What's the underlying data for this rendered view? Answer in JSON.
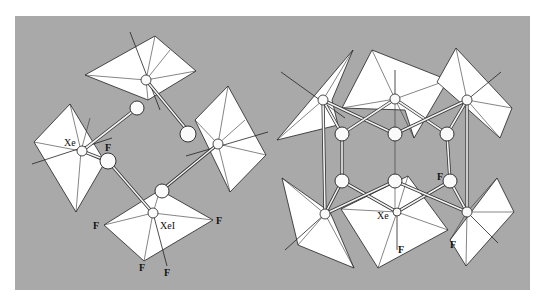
{
  "figure": {
    "background_color": "#a9a9a9",
    "polyhedron_color": "#ffffff"
  },
  "left_structure": {
    "labels": {
      "xe": "Xe",
      "xe1": "XeI",
      "f_bridge": "F",
      "f_left": "F",
      "f_right": "F",
      "f_bottom": "F",
      "f_axial": "F"
    }
  },
  "right_structure": {
    "labels": {
      "xe": "Xe",
      "f_bridge": "F",
      "f_axial": "F",
      "f_corner": "F"
    }
  }
}
